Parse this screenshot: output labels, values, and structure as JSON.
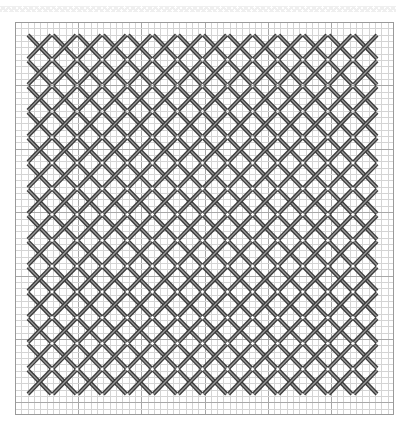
{
  "pattern": {
    "type": "cross-stitch-grid",
    "grid": {
      "cols": 60,
      "rows": 62,
      "major_every": 10,
      "minor_color": "#d4d4d4",
      "major_color": "#a8a8a8",
      "border_color": "#9a9a9a"
    },
    "stitches": {
      "columns": 14,
      "rows": 14,
      "stitch_color": "#3a3a3a",
      "stitch_highlight": "#9a9a9a",
      "glyph": "X"
    }
  }
}
